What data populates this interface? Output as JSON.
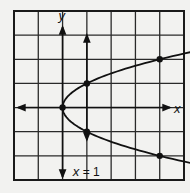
{
  "chart_data": {
    "type": "line",
    "title": "",
    "xlabel": "x",
    "ylabel": "y",
    "xlim": [
      -2,
      5
    ],
    "ylim": [
      -3,
      4
    ],
    "grid": true,
    "series": [
      {
        "name": "x = y^2",
        "equation": "x = y^2",
        "points": [
          [
            0,
            0
          ],
          [
            1,
            1
          ],
          [
            1,
            -1
          ],
          [
            4,
            2
          ],
          [
            4,
            -2
          ]
        ],
        "curve_y_range": [
          -2.3,
          2.3
        ]
      }
    ],
    "vertical_lines": [
      {
        "x": 1,
        "label": "x = 1"
      }
    ]
  },
  "labels": {
    "x_axis": "x",
    "y_axis": "y",
    "vline": "x = 1"
  },
  "colors": {
    "ink": "#111111",
    "grid": "#2a2a2a",
    "background": "#f2f2f0"
  }
}
